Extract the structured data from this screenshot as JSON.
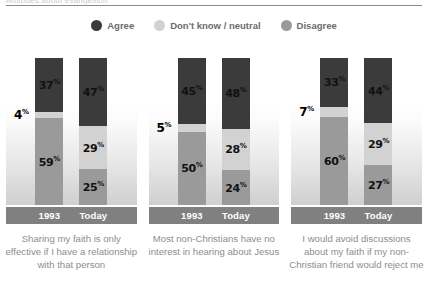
{
  "clipped_caption": "Attitudes about evangelism",
  "legend": [
    {
      "label": "Agree",
      "color": "#3b3b3b",
      "icon": "circle-swatch"
    },
    {
      "label": "Don't know / neutral",
      "color": "#d2d2d2",
      "icon": "circle-swatch"
    },
    {
      "label": "Disagree",
      "color": "#9a9a9a",
      "icon": "circle-swatch"
    }
  ],
  "colors": {
    "agree": "#3b3b3b",
    "neutral": "#d2d2d2",
    "disagree": "#9a9a9a",
    "axis_band": "#808080",
    "caption_text": "#8e8e8e",
    "legend_text": "#6b6b6b"
  },
  "chart_data": {
    "type": "bar",
    "subtype": "stacked-column-100",
    "title": "Attitudes about evangelism",
    "xlabel": "",
    "ylabel": "",
    "ylim": [
      0,
      100
    ],
    "grid": false,
    "legend_position": "top-center",
    "categories": [
      "1993",
      "Today"
    ],
    "legend_entries": [
      "Agree",
      "Don't know / neutral",
      "Disagree"
    ],
    "stack_order_top_to_bottom": [
      "Agree",
      "Don't know / neutral",
      "Disagree"
    ],
    "value_suffix": "%",
    "groups": [
      {
        "question": "Sharing my faith is only effective if I have a relationship with that person",
        "bars": [
          {
            "category": "1993",
            "segments": [
              {
                "series": "Agree",
                "value": 37,
                "label": "37",
                "label_placement": "inside"
              },
              {
                "series": "Don't know / neutral",
                "value": 4,
                "label": "4",
                "label_placement": "outside-left"
              },
              {
                "series": "Disagree",
                "value": 59,
                "label": "59",
                "label_placement": "inside"
              }
            ]
          },
          {
            "category": "Today",
            "segments": [
              {
                "series": "Agree",
                "value": 47,
                "label": "47",
                "label_placement": "inside"
              },
              {
                "series": "Don't know / neutral",
                "value": 29,
                "label": "29",
                "label_placement": "inside"
              },
              {
                "series": "Disagree",
                "value": 25,
                "label": "25",
                "label_placement": "inside"
              }
            ]
          }
        ]
      },
      {
        "question": "Most non-Christians have no interest in hearing about Jesus",
        "bars": [
          {
            "category": "1993",
            "segments": [
              {
                "series": "Agree",
                "value": 45,
                "label": "45",
                "label_placement": "inside"
              },
              {
                "series": "Don't know / neutral",
                "value": 5,
                "label": "5",
                "label_placement": "outside-left"
              },
              {
                "series": "Disagree",
                "value": 50,
                "label": "50",
                "label_placement": "inside"
              }
            ]
          },
          {
            "category": "Today",
            "segments": [
              {
                "series": "Agree",
                "value": 48,
                "label": "48",
                "label_placement": "inside"
              },
              {
                "series": "Don't know / neutral",
                "value": 28,
                "label": "28",
                "label_placement": "inside"
              },
              {
                "series": "Disagree",
                "value": 24,
                "label": "24",
                "label_placement": "inside"
              }
            ]
          }
        ]
      },
      {
        "question": "I would avoid discussions about my faith if my non-Christian friend would reject me",
        "bars": [
          {
            "category": "1993",
            "segments": [
              {
                "series": "Agree",
                "value": 33,
                "label": "33",
                "label_placement": "inside"
              },
              {
                "series": "Don't know / neutral",
                "value": 7,
                "label": "7",
                "label_placement": "outside-left"
              },
              {
                "series": "Disagree",
                "value": 60,
                "label": "60",
                "label_placement": "inside"
              }
            ]
          },
          {
            "category": "Today",
            "segments": [
              {
                "series": "Agree",
                "value": 44,
                "label": "44",
                "label_placement": "inside"
              },
              {
                "series": "Don't know / neutral",
                "value": 29,
                "label": "29",
                "label_placement": "inside"
              },
              {
                "series": "Disagree",
                "value": 27,
                "label": "27",
                "label_placement": "inside"
              }
            ]
          }
        ]
      }
    ]
  }
}
